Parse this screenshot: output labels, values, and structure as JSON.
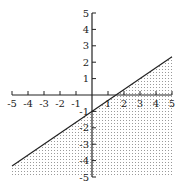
{
  "chart_data": {
    "type": "line",
    "title": "",
    "xlabel": "",
    "ylabel": "",
    "xlim": [
      -5,
      5
    ],
    "ylim": [
      -5,
      5
    ],
    "grid": false,
    "x_ticks": [
      -5,
      -4,
      -3,
      -2,
      -1,
      1,
      2,
      3,
      4,
      5
    ],
    "y_ticks": [
      5,
      4,
      3,
      2,
      1,
      -1,
      -2,
      -3,
      -4,
      -5
    ],
    "series": [
      {
        "name": "boundary line y = (2/3)x - 1",
        "x": [
          -5,
          0,
          1.5,
          5
        ],
        "y": [
          -4.33,
          -1,
          0,
          2.33
        ],
        "style": "solid"
      }
    ],
    "shaded_region": {
      "description": "region below the line (y < (2/3)x - 1), dotted fill",
      "inequality": "y < (2/3)x - 1"
    }
  },
  "colors": {
    "line": "#222222",
    "shade_dot": "#9a9a9a",
    "background": "#ffffff"
  }
}
